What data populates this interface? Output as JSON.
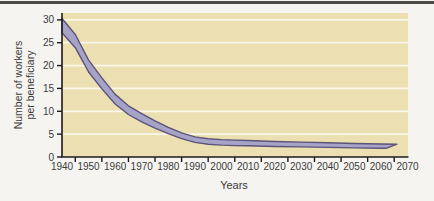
{
  "chart_data": {
    "type": "area",
    "title": "",
    "xlabel": "Years",
    "ylabel": "Number of workers per beneficiary",
    "ylabel_lines": [
      "Number of workers",
      "per beneficiary"
    ],
    "xlim": [
      1940,
      2070
    ],
    "ylim": [
      0,
      31.5
    ],
    "x_tick_labels": [
      1940,
      1950,
      1960,
      1970,
      1980,
      1990,
      2000,
      2010,
      2020,
      2030,
      2040,
      2050,
      2060,
      2070
    ],
    "x_minor_ticks": [
      1945,
      1955,
      1965,
      1975,
      1985,
      1995,
      2005,
      2015,
      2025,
      2035,
      2045,
      2055,
      2065
    ],
    "y_ticks": [
      0,
      5,
      10,
      15,
      20,
      25,
      30
    ],
    "gridline_values": [
      5,
      10,
      15,
      20,
      25,
      30
    ],
    "grid": "horizontal white lines on tan plot background",
    "legend": "none",
    "series_note": "single thick ribbon band, steep decline 1940-1995 then nearly flat to 2065",
    "band": {
      "top": [
        [
          1940,
          30.3
        ],
        [
          1945,
          26.8
        ],
        [
          1950,
          21.2
        ],
        [
          1955,
          17.3
        ],
        [
          1960,
          13.7
        ],
        [
          1965,
          11.2
        ],
        [
          1970,
          9.5
        ],
        [
          1975,
          7.9
        ],
        [
          1980,
          6.5
        ],
        [
          1985,
          5.3
        ],
        [
          1990,
          4.4
        ],
        [
          1995,
          4.0
        ],
        [
          2000,
          3.8
        ],
        [
          2005,
          3.7
        ],
        [
          2010,
          3.6
        ],
        [
          2020,
          3.4
        ],
        [
          2030,
          3.25
        ],
        [
          2040,
          3.1
        ],
        [
          2050,
          2.95
        ],
        [
          2060,
          2.85
        ],
        [
          2066,
          2.8
        ]
      ],
      "bottom": [
        [
          1940,
          27.2
        ],
        [
          1945,
          23.9
        ],
        [
          1950,
          18.6
        ],
        [
          1955,
          14.9
        ],
        [
          1960,
          11.6
        ],
        [
          1965,
          9.3
        ],
        [
          1970,
          7.7
        ],
        [
          1975,
          6.3
        ],
        [
          1980,
          5.1
        ],
        [
          1985,
          4.0
        ],
        [
          1990,
          3.2
        ],
        [
          1995,
          2.8
        ],
        [
          2000,
          2.6
        ],
        [
          2005,
          2.5
        ],
        [
          2010,
          2.45
        ],
        [
          2020,
          2.3
        ],
        [
          2030,
          2.2
        ],
        [
          2040,
          2.1
        ],
        [
          2050,
          2.0
        ],
        [
          2060,
          1.9
        ],
        [
          2062,
          1.9
        ]
      ]
    },
    "colors": {
      "page_bg": "#f5f4f0",
      "top_rule": "#4a4a48",
      "plot_bg": "#ecdfb2",
      "gridline": "#faf7ea",
      "band_fill": "#a7a2c8",
      "band_edge": "#5a5478",
      "axis": "#1c1c1c",
      "text": "#3b3b3b"
    }
  }
}
